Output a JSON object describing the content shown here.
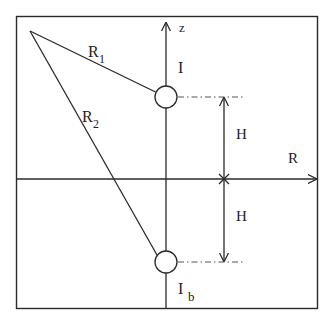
{
  "diagram": {
    "labels": {
      "r1": "R",
      "r1_sub": "1",
      "r2": "R",
      "r2_sub": "2",
      "z_axis": "z",
      "r_axis": "R",
      "current": "I",
      "image_current": "I",
      "image_current_sub": "b",
      "h_upper": "H",
      "h_lower": "H"
    },
    "colors": {
      "line": "#2a2a2a",
      "dashdot": "#555555",
      "background": "#ffffff"
    }
  }
}
